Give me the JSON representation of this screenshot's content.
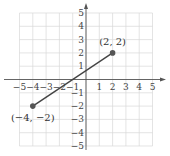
{
  "chart_data": {
    "type": "line",
    "title": "",
    "xlabel": "",
    "ylabel": "",
    "xlim": [
      -5,
      5
    ],
    "ylim": [
      -5,
      5
    ],
    "grid": true,
    "x_ticks": [
      "−5",
      "−4",
      "−3",
      "−2",
      "−1",
      "1",
      "2",
      "3",
      "4",
      "5"
    ],
    "y_ticks": [
      "5",
      "4",
      "3",
      "2",
      "1",
      "−1",
      "−2",
      "−3",
      "−4",
      "−5"
    ],
    "series": [
      {
        "name": "segment",
        "points": [
          [
            -4,
            -2
          ],
          [
            2,
            2
          ]
        ]
      }
    ],
    "annotations": [
      {
        "text": "(2, 2)",
        "x": 2,
        "y": 2
      },
      {
        "text": "(−4, −2)",
        "x": -4,
        "y": -2
      }
    ]
  },
  "colors": {
    "grid": "#d8d8d8",
    "axis": "#555555",
    "segment": "#444444",
    "point": "#555555"
  }
}
